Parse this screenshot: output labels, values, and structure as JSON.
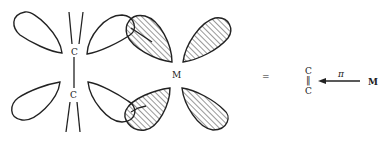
{
  "diagram": {
    "labels": {
      "carbon_top": "C",
      "carbon_bottom": "C",
      "metal": "M",
      "equals": "=",
      "scheme_carbon_top": "C",
      "scheme_carbon_bottom": "C",
      "scheme_double_bond": "‖",
      "pi_label": "π",
      "scheme_metal": "M"
    }
  }
}
